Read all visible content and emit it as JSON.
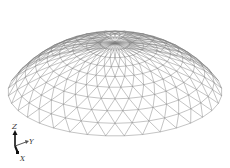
{
  "figure": {
    "background": "#ffffff",
    "line_color": "#7a7a7a",
    "dome": {
      "center_x": 115,
      "base_y": 92,
      "radius_x": 107,
      "radius_y": 44,
      "height": 80,
      "rings": 9,
      "segments": 36
    }
  },
  "axes": {
    "z_label": "Z",
    "y_label": "Y",
    "x_label": "X"
  }
}
